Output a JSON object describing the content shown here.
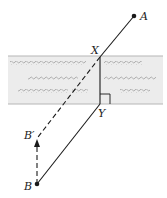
{
  "diagram": {
    "type": "geometry-reflection-river",
    "labels": {
      "A": "A",
      "B": "B",
      "B_prime": "B′",
      "X": "X",
      "Y": "Y"
    },
    "points": {
      "A": [
        134,
        16
      ],
      "B": [
        37,
        184
      ],
      "B_prime": [
        37,
        137
      ],
      "X": [
        100,
        57
      ],
      "Y": [
        100,
        104
      ]
    },
    "river": {
      "x": 8,
      "y": 56,
      "width": 155,
      "height": 48,
      "fill": "#ececec",
      "edge_color": "#b5b5b5",
      "wave_color": "#9a9a9a"
    },
    "colors": {
      "line": "#1a1a1a"
    }
  }
}
